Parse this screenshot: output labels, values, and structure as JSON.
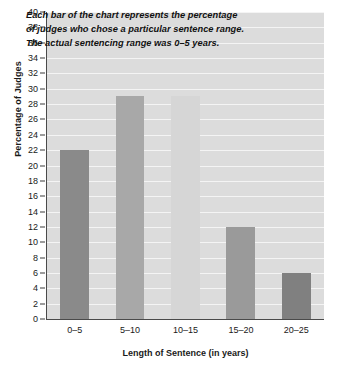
{
  "chart_data": {
    "type": "bar",
    "title": "",
    "categories": [
      "0–5",
      "5–10",
      "10–15",
      "15–20",
      "20–25"
    ],
    "values": [
      22,
      29,
      29,
      12,
      6
    ],
    "xlabel": "Length of Sentence (in years)",
    "ylabel": "Percentage of Judges",
    "ylim": [
      0,
      40
    ],
    "ytick_step": 2,
    "yticks": [
      0,
      2,
      4,
      6,
      8,
      10,
      12,
      14,
      16,
      18,
      20,
      22,
      24,
      26,
      28,
      30,
      32,
      34,
      36,
      38,
      40
    ],
    "ytick_labels": [
      "0",
      "2",
      "4",
      "6",
      "8",
      "10",
      "12",
      "14",
      "16",
      "18",
      "20",
      "22",
      "24",
      "26",
      "28",
      "30",
      "32",
      "34",
      "36",
      "38",
      "40"
    ],
    "grid": true,
    "grid_orientation": "horizontal",
    "legend": false,
    "legend_position": "none",
    "plot_background": "#dcdcdc",
    "gridline_color": "#f4f4f4",
    "bar_colors": [
      "#8a8a8a",
      "#a8a8a8",
      "#d6d6d6",
      "#9a9a9a",
      "#808080"
    ],
    "annotation": {
      "lines": [
        "Each bar of the chart represents the percentage",
        "of judges who chose a particular sentence range.",
        "The actual sentencing range was 0–5 years."
      ]
    }
  }
}
